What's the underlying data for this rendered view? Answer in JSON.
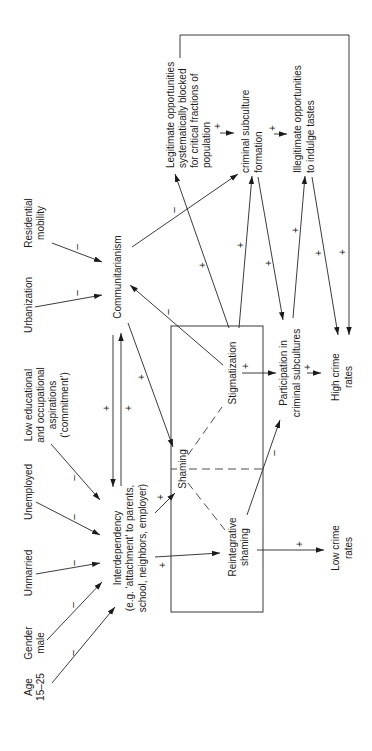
{
  "figure": {
    "nodes": {
      "age": {
        "lines": [
          "Age",
          "15–25"
        ]
      },
      "gender": {
        "lines": [
          "Gender",
          "male"
        ]
      },
      "unmarried": {
        "lines": [
          "Unmarried"
        ]
      },
      "unemployed": {
        "lines": [
          "Unemployed"
        ]
      },
      "low_aspirations": {
        "lines": [
          "Low educational",
          "and occupational",
          "aspirations",
          "(‘commitment’)"
        ]
      },
      "urbanization": {
        "lines": [
          "Urbanization"
        ]
      },
      "residential_mobility": {
        "lines": [
          "Residential",
          "mobility"
        ]
      },
      "interdependency": {
        "lines": [
          "Interdependency",
          "(e.g. ‘attachment’ to parents,",
          "school, neighbors, employer)"
        ]
      },
      "communitarianism": {
        "lines": [
          "Communitarianism"
        ]
      },
      "shaming": {
        "lines": [
          "Shaming"
        ]
      },
      "stigmatization": {
        "lines": [
          "Stigmatization"
        ]
      },
      "reintegrative_shaming": {
        "lines": [
          "Reintegrative",
          "shaming"
        ]
      },
      "participation": {
        "lines": [
          "Participation in",
          "criminal subcultures"
        ]
      },
      "high_crime": {
        "lines": [
          "High crime",
          "rates"
        ]
      },
      "low_crime": {
        "lines": [
          "Low crime",
          "rates"
        ]
      },
      "legitimate_blocked": {
        "lines": [
          "Legitimate opportunities",
          "systematically blocked",
          "for critical fractions of",
          "population"
        ]
      },
      "subculture_formation": {
        "lines": [
          "criminal subculture",
          "formation"
        ]
      },
      "illegitimate_opportunities": {
        "lines": [
          "Illegitimate opportunities",
          "to indulge tastes"
        ]
      }
    },
    "edges": [
      {
        "from": "age",
        "to": "interdependency",
        "sign": "–"
      },
      {
        "from": "gender",
        "to": "interdependency",
        "sign": "–"
      },
      {
        "from": "unmarried",
        "to": "interdependency",
        "sign": "–"
      },
      {
        "from": "unemployed",
        "to": "interdependency",
        "sign": "–"
      },
      {
        "from": "low_aspirations",
        "to": "interdependency",
        "sign": "–"
      },
      {
        "from": "urbanization",
        "to": "communitarianism",
        "sign": "–"
      },
      {
        "from": "residential_mobility",
        "to": "communitarianism",
        "sign": "–"
      },
      {
        "from": "communitarianism",
        "to": "interdependency",
        "sign": "+"
      },
      {
        "from": "interdependency",
        "to": "communitarianism",
        "sign": "+"
      },
      {
        "from": "communitarianism",
        "to": "shaming",
        "sign": "+"
      },
      {
        "from": "interdependency",
        "to": "shaming",
        "sign": "+"
      },
      {
        "from": "interdependency",
        "to": "reintegrative_shaming",
        "sign": "+"
      },
      {
        "from": "stigmatization",
        "to": "communitarianism",
        "sign": "–"
      },
      {
        "from": "communitarianism",
        "to": "subculture_formation",
        "sign": "–"
      },
      {
        "from": "stigmatization",
        "to": "legitimate_blocked",
        "sign": "+"
      },
      {
        "from": "stigmatization",
        "to": "subculture_formation",
        "sign": "+"
      },
      {
        "from": "subculture_formation",
        "to": "participation",
        "sign": "+"
      },
      {
        "from": "participation",
        "to": "illegitimate_opportunities",
        "sign": "+"
      },
      {
        "from": "illegitimate_opportunities",
        "to": "high_crime",
        "sign": "+"
      },
      {
        "from": "legitimate_blocked",
        "to": "high_crime",
        "sign": "+"
      },
      {
        "from": "legitimate_blocked",
        "to": "subculture_formation",
        "sign": "+"
      },
      {
        "from": "subculture_formation",
        "to": "illegitimate_opportunities",
        "sign": "+"
      },
      {
        "from": "stigmatization",
        "to": "participation",
        "sign": "+"
      },
      {
        "from": "participation",
        "to": "high_crime",
        "sign": "+"
      },
      {
        "from": "reintegrative_shaming",
        "to": "low_crime",
        "sign": "+"
      },
      {
        "from": "reintegrative_shaming",
        "to": "participation",
        "sign": "–"
      }
    ],
    "subtype_links": [
      {
        "parent": "shaming",
        "child": "stigmatization"
      },
      {
        "parent": "shaming",
        "child": "reintegrative_shaming"
      }
    ],
    "box_members": [
      "shaming",
      "stigmatization",
      "reintegrative_shaming"
    ]
  }
}
